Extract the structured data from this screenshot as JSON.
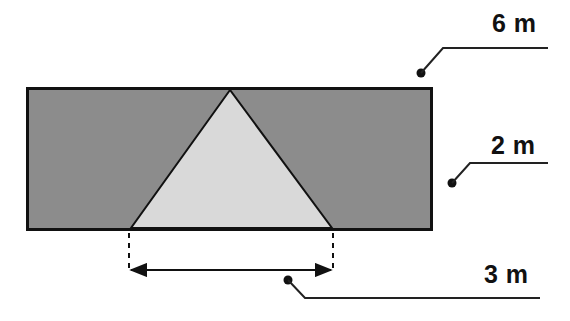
{
  "diagram": {
    "type": "geometry-figure",
    "colors": {
      "rectangle_fill": "#8c8c8c",
      "triangle_fill": "#d9d9d9",
      "stroke": "#111111",
      "background": "#ffffff"
    },
    "labels": {
      "rectangle_width": "6 m",
      "rectangle_height": "2 m",
      "triangle_base": "3 m"
    }
  }
}
